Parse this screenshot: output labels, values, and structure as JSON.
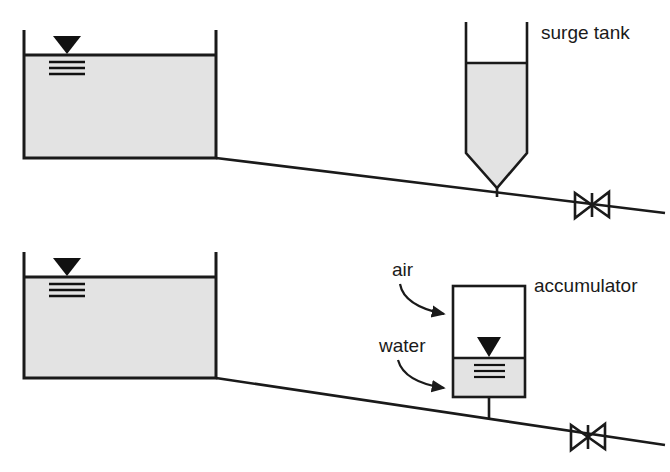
{
  "figure": {
    "background_color": "#ffffff",
    "line_color": "#1a1a1a",
    "water_fill_color": "#e3e3e3",
    "air_fill_color": "#ffffff"
  },
  "labels": {
    "surge_tank": "surge tank",
    "accumulator": "accumulator",
    "air": "air",
    "water": "water"
  },
  "systems": [
    {
      "name": "surge-tank-system",
      "reservoir": {
        "name": "upper-reservoir",
        "left": 24,
        "right": 216,
        "water_surface_y": 55,
        "bottom": 158,
        "wall_top": 30,
        "fill": "#e3e3e3",
        "water_level_symbol": {
          "x": 67,
          "y": 55
        }
      },
      "pipe": {
        "name": "upper-pipeline",
        "start": [
          216,
          158
        ],
        "end": [
          665,
          213
        ]
      },
      "vessel": {
        "name": "surge-tank",
        "type": "open-top cylinder with conical bottom",
        "left": 466,
        "right": 527,
        "top": 22,
        "water_surface_y": 63,
        "barrel_bottom": 153,
        "cone_tip_y": 187,
        "stem_bottom_y": 197,
        "fill": "#e3e3e3"
      },
      "valve": {
        "name": "upper-valve",
        "type": "gate-valve-bowtie",
        "center": [
          592,
          205
        ],
        "half_width": 17,
        "half_height": 13
      }
    },
    {
      "name": "accumulator-system",
      "reservoir": {
        "name": "lower-reservoir",
        "left": 24,
        "right": 216,
        "water_surface_y": 277,
        "bottom": 378,
        "wall_top": 252,
        "fill": "#e3e3e3",
        "water_level_symbol": {
          "x": 67,
          "y": 277
        }
      },
      "pipe": {
        "name": "lower-pipeline",
        "start": [
          216,
          378
        ],
        "end": [
          665,
          445
        ]
      },
      "vessel": {
        "name": "accumulator",
        "type": "closed rectangular vessel",
        "left": 453,
        "right": 525,
        "top": 286,
        "water_surface_y": 358,
        "bottom": 397,
        "stem_bottom_y": 415,
        "air_fill": "#ffffff",
        "water_fill": "#e3e3e3",
        "water_level_symbol": {
          "x": 489,
          "y": 358
        }
      },
      "valve": {
        "name": "lower-valve",
        "type": "gate-valve-bowtie",
        "center": [
          588,
          437
        ],
        "half_width": 17,
        "half_height": 13
      }
    }
  ],
  "annotations": [
    {
      "name": "air-callout",
      "label_key": "air",
      "text_x": 392,
      "text_y": 276,
      "arrow_start": [
        400,
        284
      ],
      "arrow_control": [
        404,
        304
      ],
      "arrow_end": [
        449,
        315
      ]
    },
    {
      "name": "water-callout",
      "label_key": "water",
      "text_x": 379,
      "text_y": 352,
      "arrow_start": [
        398,
        360
      ],
      "arrow_control": [
        404,
        380
      ],
      "arrow_end": [
        449,
        389
      ]
    },
    {
      "name": "surge-tank-label",
      "label_key": "surge_tank",
      "text_x": 541,
      "text_y": 39
    },
    {
      "name": "accumulator-label",
      "label_key": "accumulator",
      "text_x": 534,
      "text_y": 292
    }
  ]
}
